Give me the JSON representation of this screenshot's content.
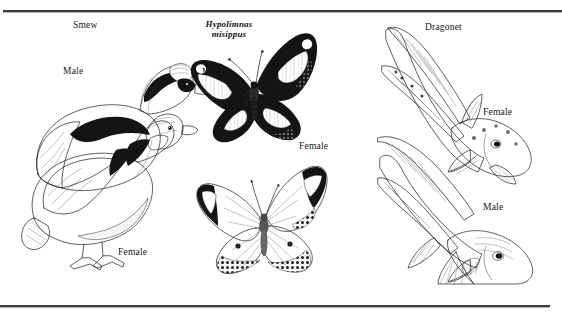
{
  "plate": {
    "title": "Sexual dimorphism plate",
    "background_color": "#ffffff",
    "ink_color": "#141414",
    "rule_color": "#3b3b3b"
  },
  "panels": [
    {
      "id": "smew",
      "common_name": "Smew",
      "name_style": "roman",
      "subject_type": "bird",
      "sexes": [
        {
          "label": "Male",
          "description": "white plumage with bold black crest stripe, black eye patch and black breast bars, grey flanks"
        },
        {
          "label": "Female",
          "description": "grey-brown body with chestnut head and white cheek"
        }
      ]
    },
    {
      "id": "hypolimnas",
      "common_name": "Hypolimnas misippus",
      "name_style": "bold-italic",
      "name_line_1": "Hypolimnas",
      "name_line_2": "misippus",
      "subject_type": "butterfly",
      "sexes": [
        {
          "label": "Male",
          "description": "black wings with large white oval patches and blue-edged margins"
        },
        {
          "label": "Female",
          "description": "pale orange-white wings with dark apex bearing white band and dark spotted margins"
        }
      ]
    },
    {
      "id": "dragonet",
      "common_name": "Dragonet",
      "name_style": "roman",
      "subject_type": "fish",
      "sexes": [
        {
          "label": "Female",
          "description": "mottled body with short first dorsal fin"
        },
        {
          "label": "Male",
          "description": "elongated first dorsal fin filament and larger patterned fins"
        }
      ]
    }
  ],
  "labels": {
    "smew_title": "Smew",
    "smew_male": "Male",
    "smew_female": "Female",
    "butterfly_name_1": "Hypolimnas",
    "butterfly_name_2": "misippus",
    "butterfly_male": "Male",
    "butterfly_female": "Female",
    "dragonet_title": "Dragonet",
    "dragonet_female": "Female",
    "dragonet_male": "Male"
  }
}
